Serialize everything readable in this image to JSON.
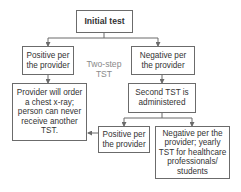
{
  "diagram": {
    "title": "Initial test",
    "side_label": "Two-step TST",
    "nodes": {
      "initial": {
        "text": "Initial test"
      },
      "positive_1": {
        "text": "Positive per the provider"
      },
      "negative_1": {
        "text": "Negative per the provider"
      },
      "chest_xray": {
        "text": "Provider will order a chest x-ray; person can never receive another TST."
      },
      "second_tst": {
        "text": "Second TST is administered"
      },
      "positive_2": {
        "text": "Positive per the provider"
      },
      "negative_2": {
        "text": "Negative per the provider; yearly TST for healthcare professionals/ students"
      }
    },
    "edges": [
      {
        "from": "initial",
        "to": "positive_1"
      },
      {
        "from": "initial",
        "to": "negative_1"
      },
      {
        "from": "positive_1",
        "to": "chest_xray"
      },
      {
        "from": "negative_1",
        "to": "second_tst"
      },
      {
        "from": "second_tst",
        "to": "positive_2"
      },
      {
        "from": "second_tst",
        "to": "negative_2"
      },
      {
        "from": "positive_2",
        "to": "chest_xray"
      }
    ],
    "colors": {
      "line": "#6b6b6b",
      "text": "#333333",
      "label": "#8a8a8a"
    }
  }
}
